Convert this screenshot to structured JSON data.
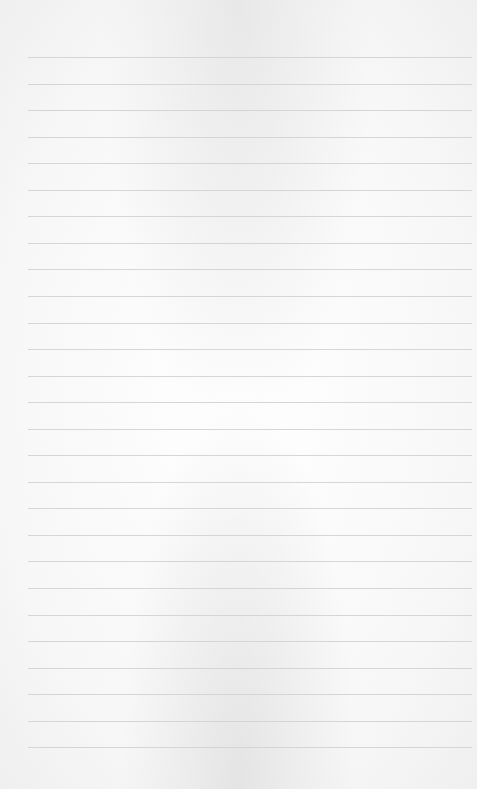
{
  "paper": {
    "type": "lined-paper",
    "line_count": 27,
    "first_line_y": 57,
    "line_spacing": 26.55,
    "line_color": "#d2d2d2",
    "background_color": "#f6f6f6"
  }
}
